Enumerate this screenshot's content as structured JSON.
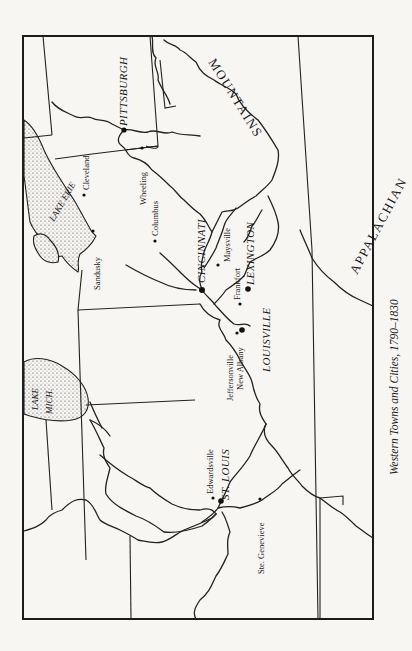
{
  "caption": "Western Towns and Cities, 1790–1830",
  "map": {
    "mountains": {
      "part1": "APPALACHIAN",
      "part2": "MOUNTAINS"
    },
    "lakes": {
      "erie": "LAKE ERIE",
      "michigan_line1": "LAKE",
      "michigan_line2": "MICH."
    },
    "cities": {
      "pittsburgh": "PITTSBURGH",
      "cincinnati": "CINCINNATI",
      "lexington": "LEXINGTON",
      "louisville": "LOUISVILLE",
      "st_louis": "ST. LOUIS"
    },
    "towns": {
      "cleveland": "Cleveland",
      "sandusky": "Sandusky",
      "wheeling": "Wheeling",
      "columbus": "Columbus",
      "maysville": "Maysville",
      "frankfort": "Frankfort",
      "jeffersonville": "Jeffersonville",
      "new_albany": "New Albany",
      "edwardsville": "Edwardsville",
      "ste_genevieve": "Ste. Genevieve"
    }
  }
}
